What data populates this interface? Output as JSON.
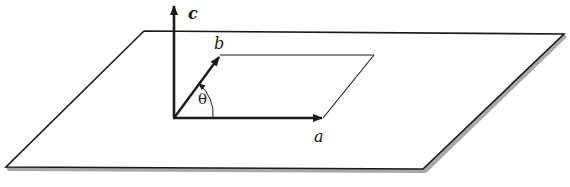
{
  "diagram": {
    "type": "lattice-vectors-on-plane",
    "labels": {
      "a": "a",
      "b": "b",
      "c": "c",
      "angle": "θ"
    },
    "colors": {
      "stroke": "#1a1a1a",
      "plane_shadow": "#a8a8a8",
      "background": "#ffffff"
    },
    "elements": [
      {
        "name": "plane",
        "shape": "parallelogram",
        "vertices": [
          [
            144,
            31
          ],
          [
            564,
            34
          ],
          [
            423,
            169
          ],
          [
            6,
            167
          ]
        ]
      },
      {
        "name": "unit-cell",
        "shape": "parallelogram",
        "vertices": [
          [
            174,
            118
          ],
          [
            323,
            118
          ],
          [
            374,
            55
          ],
          [
            220,
            55
          ]
        ]
      },
      {
        "name": "vector-a",
        "from": [
          174,
          118
        ],
        "to": [
          323,
          118
        ],
        "label": "a"
      },
      {
        "name": "vector-b",
        "from": [
          174,
          118
        ],
        "to": [
          220,
          56
        ],
        "label": "b"
      },
      {
        "name": "vector-c",
        "from": [
          174,
          118
        ],
        "to": [
          174,
          4
        ],
        "label": "c"
      },
      {
        "name": "angle-theta",
        "between": [
          "a",
          "b"
        ],
        "label": "θ"
      }
    ]
  }
}
